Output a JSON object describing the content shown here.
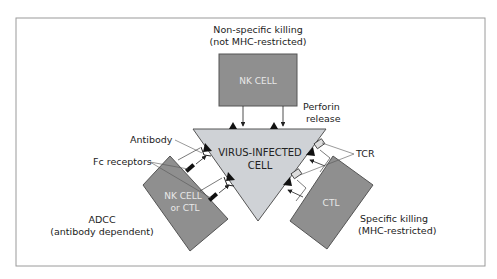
{
  "diagram": {
    "colors": {
      "frame": "#9a9a9a",
      "cell_fill": "#8f8f8f",
      "cell_stroke": "#555555",
      "target_fill": "#cfd2d6",
      "target_stroke": "#555555",
      "receptor": "#111111"
    },
    "target_cell": {
      "line1": "VIRUS-INFECTED",
      "line2": "CELL"
    },
    "top": {
      "caption_line1": "Non-specific killing",
      "caption_line2": "(not MHC-restricted)",
      "cell_label": "NK CELL",
      "perforin_line1": "Perforin",
      "perforin_line2": "release"
    },
    "left": {
      "cell_line1": "NK CELL",
      "cell_line2": "or CTL",
      "antibody_label": "Antibody",
      "fc_label": "Fc receptors",
      "caption_line1": "ADCC",
      "caption_line2": "(antibody dependent)"
    },
    "right": {
      "cell_label": "CTL",
      "tcr_label": "TCR",
      "caption_line1": "Specific killing",
      "caption_line2": "(MHC-restricted)"
    }
  }
}
